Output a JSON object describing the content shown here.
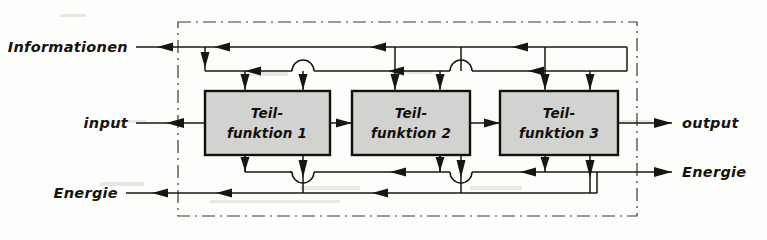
{
  "diagram": {
    "frame": {
      "name": "system-boundary",
      "style": "dash-dot",
      "color": "#3a3933"
    },
    "colors": {
      "line": "#171613",
      "box_fill": "#d2d2d0",
      "box_stroke": "#100f0c",
      "frame": "#3a3933",
      "background": "#fdfdfb"
    },
    "blocks": [
      {
        "id": "teilfunktion-1",
        "line1": "Teil-",
        "line2": "funktion 1"
      },
      {
        "id": "teilfunktion-2",
        "line1": "Teil-",
        "line2": "funktion 2"
      },
      {
        "id": "teilfunktion-3",
        "line1": "Teil-",
        "line2": "funktion 3"
      }
    ],
    "inputs": [
      {
        "id": "informationen",
        "label": "Informationen",
        "side": "left",
        "row": "top"
      },
      {
        "id": "input",
        "label": "input",
        "side": "left",
        "row": "middle"
      },
      {
        "id": "energie-in",
        "label": "Energie",
        "side": "left",
        "row": "bottom"
      }
    ],
    "outputs": [
      {
        "id": "output",
        "label": "output",
        "side": "right",
        "row": "middle"
      },
      {
        "id": "energie-out",
        "label": "Energie",
        "side": "right",
        "row": "lower"
      }
    ],
    "connector_notes": {
      "hop": "semicircular line-hop (crossing without junction)",
      "arrow": "solid filled triangular arrowhead"
    }
  }
}
